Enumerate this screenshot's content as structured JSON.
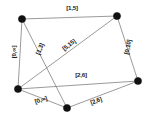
{
  "diagram": {
    "type": "graph-network",
    "background_color": "#ffffff",
    "node_color": "#111111",
    "edge_color": "#8e8e8e",
    "label_color": "#1a1a1a",
    "nodes": [
      {
        "id": "n1",
        "name": "node-top-left",
        "x": 22,
        "y": 19
      },
      {
        "id": "n2",
        "name": "node-top-right",
        "x": 117,
        "y": 16
      },
      {
        "id": "n3",
        "name": "node-left-bottom",
        "x": 18,
        "y": 89
      },
      {
        "id": "n4",
        "name": "node-bottom",
        "x": 67,
        "y": 108
      },
      {
        "id": "n5",
        "name": "node-right",
        "x": 138,
        "y": 81
      }
    ],
    "edges": [
      {
        "id": "e1",
        "name": "edge-top",
        "from": "n1",
        "to": "n2",
        "label": "[1,5]"
      },
      {
        "id": "e2",
        "name": "edge-left",
        "from": "n1",
        "to": "n3",
        "label": "[0,∞]"
      },
      {
        "id": "e3",
        "name": "edge-topleft-bottom",
        "from": "n1",
        "to": "n4",
        "label": "[1,3]"
      },
      {
        "id": "e4",
        "name": "edge-leftbottom-topright",
        "from": "n3",
        "to": "n2",
        "label": "[5,15]"
      },
      {
        "id": "e5",
        "name": "edge-right",
        "from": "n2",
        "to": "n5",
        "label": "[0,10]"
      },
      {
        "id": "e6",
        "name": "edge-middle",
        "from": "n3",
        "to": "n5",
        "label": "[2,6]"
      },
      {
        "id": "e7",
        "name": "edge-bottom-left",
        "from": "n3",
        "to": "n4",
        "label": "[0,∞]"
      },
      {
        "id": "e8",
        "name": "edge-bottom-right",
        "from": "n4",
        "to": "n5",
        "label": "[2,6]"
      }
    ],
    "labels": [
      {
        "id": "l1",
        "name": "edge-label-top",
        "text": "[1,5]",
        "x": 72,
        "y": 8,
        "rotation": 0
      },
      {
        "id": "l2",
        "name": "edge-label-left",
        "text": "[0,∞]",
        "x": 14,
        "y": 52,
        "rotation": -90
      },
      {
        "id": "l3",
        "name": "edge-label-topleft-bottom",
        "text": "[1,3]",
        "x": 40,
        "y": 49,
        "rotation": -68
      },
      {
        "id": "l4",
        "name": "edge-label-leftbottom-topright",
        "text": "[5,15]",
        "x": 69,
        "y": 45,
        "rotation": -37
      },
      {
        "id": "l5",
        "name": "edge-label-right",
        "text": "[0,10]",
        "x": 128,
        "y": 47,
        "rotation": -78
      },
      {
        "id": "l6",
        "name": "edge-label-middle",
        "text": "[2,6]",
        "x": 81,
        "y": 75,
        "rotation": 0
      },
      {
        "id": "l7",
        "name": "edge-label-bottom-left",
        "text": "[0,∞]",
        "x": 41,
        "y": 100,
        "rotation": -18
      },
      {
        "id": "l8",
        "name": "edge-label-bottom-right",
        "text": "[2,6]",
        "x": 96,
        "y": 101,
        "rotation": -20
      }
    ]
  }
}
